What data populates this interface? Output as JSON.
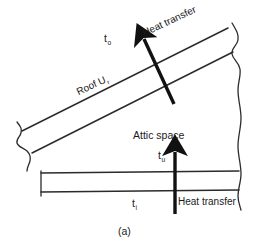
{
  "figure": {
    "caption": "(a)",
    "colors": {
      "background": "#ffffff",
      "line": "#2b2b2b",
      "arrow": "#111111",
      "text": "#1a1a1a"
    }
  },
  "labels": {
    "outdoor_temp": "t",
    "outdoor_temp_sub": "o",
    "roof_u": "Roof U",
    "roof_u_sub": "r",
    "heat_transfer_roof": "Heat transfer",
    "attic_space": "Attic space",
    "attic_temp": "t",
    "attic_temp_sub": "u",
    "indoor_temp": "t",
    "indoor_temp_sub": "i",
    "heat_transfer_ceiling": "Heat transfer"
  },
  "elements": {
    "roof_upper_line": "roof-outer-surface",
    "roof_lower_line": "roof-inner-surface",
    "ceiling_upper_line": "ceiling-top-surface",
    "ceiling_lower_line": "ceiling-bottom-surface",
    "left_break": "left-break-line",
    "right_break": "right-break-line",
    "roof_arrow": "roof-heat-flow-arrow",
    "ceiling_arrow": "ceiling-heat-flow-arrow"
  }
}
